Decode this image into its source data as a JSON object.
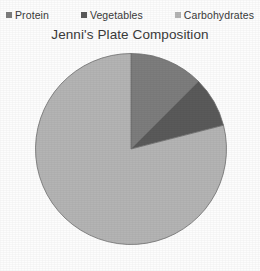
{
  "chart_data": {
    "type": "pie",
    "title": "Jenni's Plate Composition",
    "xlabel": "",
    "ylabel": "",
    "legend_position": "top",
    "grid": false,
    "start_angle_deg": 0,
    "direction": "clockwise",
    "categories": [
      "Protein",
      "Vegetables",
      "Carbohydrates"
    ],
    "values": [
      12.5,
      8.5,
      79
    ],
    "units": "percent",
    "colors": [
      "#7d7d7d",
      "#5a5a5a",
      "#b4b4b4"
    ],
    "slices": [
      {
        "label": "Protein",
        "value": 12.5,
        "color": "#7d7d7d",
        "start_deg": 0,
        "end_deg": 45
      },
      {
        "label": "Vegetables",
        "value": 8.5,
        "color": "#5a5a5a",
        "start_deg": 45,
        "end_deg": 75.6
      },
      {
        "label": "Carbohydrates",
        "value": 79,
        "color": "#b4b4b4",
        "start_deg": 75.6,
        "end_deg": 360
      }
    ],
    "slice_border_color": "#6e6e6e"
  },
  "legend": {
    "items": [
      {
        "label": "Protein",
        "color": "#7d7d7d"
      },
      {
        "label": "Vegetables",
        "color": "#5a5a5a"
      },
      {
        "label": "Carbohydrates",
        "color": "#b4b4b4"
      }
    ]
  },
  "title": "Jenni's Plate Composition"
}
